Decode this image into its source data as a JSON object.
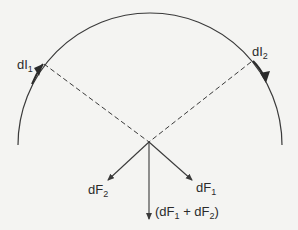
{
  "figure": {
    "colors": {
      "background": "#f4f4f2",
      "stroke": "#3a3a3a"
    },
    "arc": {
      "center": [
        149,
        142
      ],
      "radius": 128
    },
    "current_elements": [
      {
        "id": "dI1",
        "label_main": "dI",
        "label_sub": "1",
        "direction": "up-along-arc"
      },
      {
        "id": "dI2",
        "label_main": "dI",
        "label_sub": "2",
        "direction": "down-along-arc"
      }
    ],
    "forces": [
      {
        "id": "dF2",
        "label_main": "dF",
        "label_sub": "2"
      },
      {
        "id": "dF1",
        "label_main": "dF",
        "label_sub": "1"
      }
    ],
    "resultant": {
      "open": "(dF",
      "sub1": "1",
      "plus": " + dF",
      "sub2": "2",
      "close": ")"
    }
  }
}
